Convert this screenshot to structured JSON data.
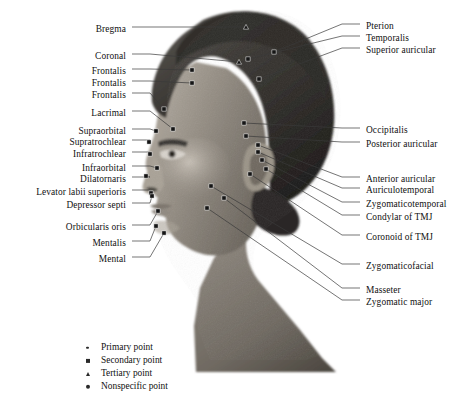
{
  "figure": {
    "image_alt": "Grayscale lateral profile photograph of a human head with marked anatomical landmark points"
  },
  "labels_left": [
    {
      "text": "Bregma",
      "x": 126,
      "y": 24,
      "lx": 132,
      "ly": 27,
      "px": 246,
      "py": 27,
      "marker": "triangle"
    },
    {
      "text": "Coronal",
      "x": 126,
      "y": 51,
      "lx": 132,
      "ly": 54,
      "px": 239,
      "py": 62,
      "marker": "triangle"
    },
    {
      "text": "Frontalis",
      "x": 126,
      "y": 66,
      "lx": 132,
      "ly": 69,
      "px": 192,
      "py": 70,
      "marker": "square"
    },
    {
      "text": "Frontalis",
      "x": 126,
      "y": 78,
      "lx": 132,
      "ly": 81,
      "px": 192,
      "py": 83,
      "marker": "square"
    },
    {
      "text": "Frontalis",
      "x": 126,
      "y": 90,
      "lx": 132,
      "ly": 93,
      "px": 164,
      "py": 109,
      "marker": "square"
    },
    {
      "text": "Lacrimal",
      "x": 126,
      "y": 108,
      "lx": 132,
      "ly": 111,
      "px": 173,
      "py": 129,
      "marker": "square"
    },
    {
      "text": "Supraorbital",
      "x": 126,
      "y": 126,
      "lx": 132,
      "ly": 129,
      "px": 156,
      "py": 131,
      "marker": "square"
    },
    {
      "text": "Supratrochlear",
      "x": 126,
      "y": 137,
      "lx": 132,
      "ly": 140,
      "px": 149,
      "py": 142,
      "marker": "square"
    },
    {
      "text": "Infratrochlear",
      "x": 126,
      "y": 149,
      "lx": 132,
      "ly": 152,
      "px": 150,
      "py": 154,
      "marker": "square"
    },
    {
      "text": "Infraorbital",
      "x": 126,
      "y": 163,
      "lx": 132,
      "ly": 166,
      "px": 157,
      "py": 168,
      "marker": "square"
    },
    {
      "text": "Dilatornaris",
      "x": 126,
      "y": 174,
      "lx": 132,
      "ly": 177,
      "px": 146,
      "py": 176,
      "marker": "square"
    },
    {
      "text": "Levator labii superioris",
      "x": 126,
      "y": 187,
      "lx": 132,
      "ly": 190,
      "px": 151,
      "py": 193,
      "marker": "square"
    },
    {
      "text": "Depressor septi",
      "x": 126,
      "y": 200,
      "lx": 132,
      "ly": 203,
      "px": 152,
      "py": 196,
      "marker": "square"
    },
    {
      "text": "Orbicularis oris",
      "x": 126,
      "y": 222,
      "lx": 132,
      "ly": 225,
      "px": 158,
      "py": 211,
      "marker": "square"
    },
    {
      "text": "Mentalis",
      "x": 126,
      "y": 238,
      "lx": 132,
      "ly": 241,
      "px": 156,
      "py": 226,
      "marker": "square"
    },
    {
      "text": "Mental",
      "x": 126,
      "y": 254,
      "lx": 132,
      "ly": 257,
      "px": 164,
      "py": 233,
      "marker": "square"
    }
  ],
  "labels_right": [
    {
      "text": "Pterion",
      "x": 366,
      "y": 21,
      "lx": 360,
      "ly": 24,
      "px": 274,
      "py": 52,
      "marker": "square"
    },
    {
      "text": "Temporalis",
      "x": 366,
      "y": 33,
      "lx": 360,
      "ly": 36,
      "px": 248,
      "py": 59,
      "marker": "square"
    },
    {
      "text": "Superior auricular",
      "x": 366,
      "y": 45,
      "lx": 360,
      "ly": 48,
      "px": 259,
      "py": 79,
      "marker": "square"
    },
    {
      "text": "Occipitalis",
      "x": 366,
      "y": 125,
      "lx": 360,
      "ly": 128,
      "px": 244,
      "py": 123,
      "marker": "square"
    },
    {
      "text": "Posterior auricular",
      "x": 366,
      "y": 139,
      "lx": 360,
      "ly": 142,
      "px": 246,
      "py": 136,
      "marker": "square"
    },
    {
      "text": "Anterior auricular",
      "x": 366,
      "y": 174,
      "lx": 360,
      "ly": 177,
      "px": 258,
      "py": 145,
      "marker": "square"
    },
    {
      "text": "Auriculotemporal",
      "x": 366,
      "y": 185,
      "lx": 360,
      "ly": 188,
      "px": 258,
      "py": 152,
      "marker": "square"
    },
    {
      "text": "Zygomaticotemporal",
      "x": 366,
      "y": 199,
      "lx": 360,
      "ly": 202,
      "px": 262,
      "py": 160,
      "marker": "square"
    },
    {
      "text": "Condylar of TMJ",
      "x": 366,
      "y": 212,
      "lx": 360,
      "ly": 215,
      "px": 266,
      "py": 169,
      "marker": "square"
    },
    {
      "text": "Coronoid of TMJ",
      "x": 366,
      "y": 232,
      "lx": 360,
      "ly": 235,
      "px": 250,
      "py": 174,
      "marker": "square"
    },
    {
      "text": "Zygomaticofacial",
      "x": 366,
      "y": 261,
      "lx": 360,
      "ly": 264,
      "px": 211,
      "py": 186,
      "marker": "square"
    },
    {
      "text": "Masseter",
      "x": 366,
      "y": 285,
      "lx": 360,
      "ly": 288,
      "px": 224,
      "py": 198,
      "marker": "square"
    },
    {
      "text": "Zygomatic major",
      "x": 366,
      "y": 297,
      "lx": 360,
      "ly": 300,
      "px": 207,
      "py": 208,
      "marker": "square"
    }
  ],
  "legend": {
    "items": [
      {
        "label": "Primary point",
        "marker": "dot-small"
      },
      {
        "label": "Secondary point",
        "marker": "square"
      },
      {
        "label": "Tertiary point",
        "marker": "triangle"
      },
      {
        "label": "Nonspecific point",
        "marker": "dot-large"
      }
    ]
  },
  "colors": {
    "text": "#111111",
    "leader": "#3a3a3a",
    "marker_dark": "#151515",
    "marker_light": "#f2f2f2",
    "background": "#ffffff"
  }
}
